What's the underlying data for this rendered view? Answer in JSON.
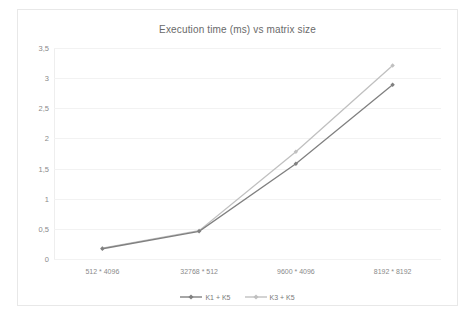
{
  "chart_data": {
    "type": "line",
    "title": "Execution time (ms) vs matrix size",
    "xlabel": "",
    "ylabel": "",
    "categories": [
      "512 * 4096",
      "32768 * 512",
      "9600 * 4096",
      "8192 * 8192"
    ],
    "series": [
      {
        "name": "K1 + K5",
        "values": [
          0.17,
          0.46,
          1.58,
          2.89
        ],
        "color": "#808080"
      },
      {
        "name": "K3 + K5",
        "values": [
          0.18,
          0.47,
          1.78,
          3.21
        ],
        "color": "#c0c0c0"
      }
    ],
    "ylim": [
      0,
      3.5
    ],
    "yticks": [
      0,
      0.5,
      1,
      1.5,
      2,
      2.5,
      3,
      3.5
    ],
    "ytick_labels": [
      "0",
      "0,5",
      "1",
      "1,5",
      "2",
      "2,5",
      "3",
      "3,5"
    ],
    "grid": true,
    "legend_position": "bottom",
    "marker": "diamond",
    "background": "#ffffff",
    "gridline_color": "#f2f2f2",
    "border_color": "#e8e8e8",
    "text_color": "#8a8a8a"
  }
}
